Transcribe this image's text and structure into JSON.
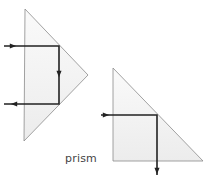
{
  "diagram": {
    "label": "prism",
    "colors": {
      "prism_fill": "#f2f2f2",
      "prism_edge": "#8a8a8a",
      "ray": "#222222",
      "label": "#444444"
    },
    "prisms": [
      {
        "name": "prism-retroreflector",
        "description": "Right-angle prism with hypotenuse facing the incoming beam; ray enters, reflects twice and exits antiparallel",
        "vertices": [
          [
            25,
            9
          ],
          [
            88,
            75
          ],
          [
            24,
            141
          ]
        ],
        "ray_path": [
          [
            4,
            46
          ],
          [
            59,
            46
          ],
          [
            59,
            104
          ],
          [
            4,
            104
          ]
        ],
        "ray_arrows": [
          {
            "at": [
              13,
              46
            ],
            "direction": "right"
          },
          {
            "at": [
              59,
              74
            ],
            "direction": "down"
          },
          {
            "at": [
              14,
              104
            ],
            "direction": "left"
          }
        ]
      },
      {
        "name": "prism-90-degree-deflector",
        "description": "Right-angle prism deflecting the beam by 90 degrees",
        "vertices": [
          [
            113,
            68
          ],
          [
            203,
            161
          ],
          [
            113,
            161
          ]
        ],
        "ray_path": [
          [
            101,
            115
          ],
          [
            157,
            115
          ],
          [
            157,
            175
          ]
        ],
        "ray_arrows": [
          {
            "at": [
              106,
              115
            ],
            "direction": "right"
          },
          {
            "at": [
              157,
              171
            ],
            "direction": "down"
          }
        ]
      }
    ]
  }
}
